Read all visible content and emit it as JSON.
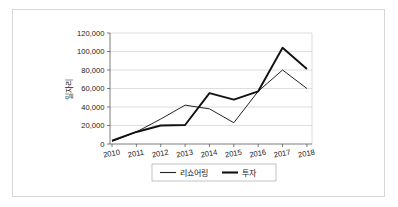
{
  "chart_data": {
    "type": "line",
    "title": "",
    "xlabel": "",
    "ylabel": "일자리",
    "categories": [
      "2010",
      "2011",
      "2012",
      "2013",
      "2014",
      "2015",
      "2016",
      "2017",
      "2018"
    ],
    "ylim": [
      0,
      120000
    ],
    "yticks": [
      0,
      20000,
      40000,
      60000,
      80000,
      100000,
      120000
    ],
    "ytick_labels": [
      "0",
      "20,000",
      "40,000",
      "60,000",
      "80,000",
      "100,000",
      "120,000"
    ],
    "grid": true,
    "legend_position": "bottom",
    "series": [
      {
        "name": "리쇼어링",
        "values": [
          3000,
          13000,
          27000,
          42000,
          38000,
          23000,
          57000,
          80000,
          60000
        ]
      },
      {
        "name": "투자",
        "values": [
          3500,
          13000,
          20000,
          20500,
          55000,
          48000,
          57000,
          104000,
          81000
        ]
      }
    ]
  },
  "legend": {
    "entries": [
      {
        "label": "리쇼어링",
        "style": "thin-line"
      },
      {
        "label": "투자",
        "style": "thick-line"
      }
    ]
  },
  "colors": {
    "series_reshoring": "#232323",
    "series_investment": "#111111",
    "gridline": "#c8c8c8",
    "axis": "#5a5a5a",
    "frame_border": "#d6d6d6",
    "background": "#ffffff"
  }
}
